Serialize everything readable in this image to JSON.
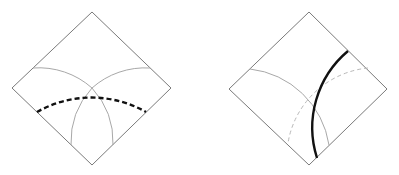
{
  "figure": {
    "panels": [
      {
        "id": "left",
        "diamond": {
          "top": [
            92,
            12
          ],
          "right": [
            171,
            88
          ],
          "bottom": [
            92,
            165
          ],
          "left": [
            12,
            88
          ]
        },
        "thin_arcs": [
          {
            "d": "M 33 68 A 80 80 0 0 1 92 88"
          },
          {
            "d": "M 150 68 A 80 80 0 0 0 92 88"
          },
          {
            "d": "M 92 88 A 80 80 0 0 0 71 145"
          },
          {
            "d": "M 92 88 A 80 80 0 0 1 113 145"
          }
        ],
        "dashed_arc": {
          "d": "M 37 112 A 110 110 0 0 1 146 112"
        }
      },
      {
        "id": "right",
        "diamond": {
          "top": [
            309,
            12
          ],
          "right": [
            387,
            89
          ],
          "bottom": [
            309,
            165
          ],
          "left": [
            229,
            89
          ]
        },
        "thin_arcs": [
          {
            "d": "M 250 69 A 90 90 0 0 1 329 145"
          }
        ],
        "dashed_arcs": [
          {
            "d": "M 368 68 A 90 90 0 0 0 288 143"
          }
        ],
        "bold_arc": {
          "d": "M 348 51 A 100 100 0 0 0 317 158"
        }
      }
    ],
    "colors": {
      "edge": "#7a7a7a",
      "thin_arc": "#a8a8a8",
      "dashed_thin": "#b8b8b8",
      "bold": "#111111"
    }
  }
}
